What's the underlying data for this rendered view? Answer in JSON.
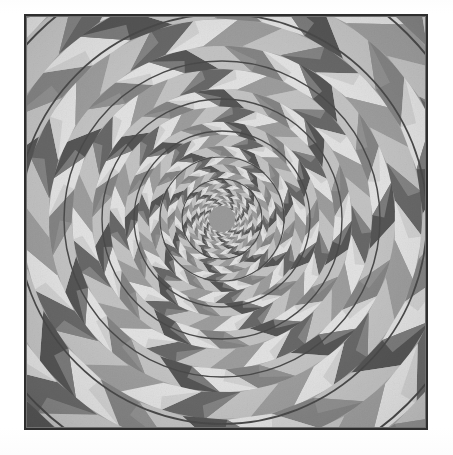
{
  "document": {
    "page_background": "#ffffff",
    "figure": {
      "name": "concentric-circles-illusion",
      "title": "",
      "caption": "",
      "frame": {
        "x": 24,
        "y": 14,
        "width": 404,
        "height": 416,
        "border_color": "#2e2e2e",
        "border_width": 2
      }
    }
  },
  "illusion": {
    "kind": "fraser-spiral",
    "description": "Concentric circles illusion: alternating light and dark wedge segments arranged in concentric annular bands, each band rotated relative to its neighbour, overlaid with thin dark circle outlines that appear to form a spiral.",
    "center": {
      "x": 198,
      "y": 205
    },
    "colors": {
      "light": "#e2e2e2",
      "mid_light": "#c3c3c3",
      "mid": "#9d9d9d",
      "mid_dark": "#848484",
      "dark": "#676767",
      "darkest": "#555555",
      "ring_line": "#4a4a4a",
      "center_disc": "#9a9a9a",
      "background": "#a5a5a5"
    },
    "geometry": {
      "sectors": 28,
      "band_count": 22,
      "band_growth": 1.155,
      "inner_radius": 13,
      "outer_radius": 330,
      "twist_per_band_deg": 6.4,
      "wedge_skew_deg": 5.5
    },
    "rings": [
      {
        "index": 1,
        "radius": 40,
        "stroke_width": 1.1
      },
      {
        "index": 2,
        "radius": 62,
        "stroke_width": 1.2
      },
      {
        "index": 3,
        "radius": 88,
        "stroke_width": 1.3
      },
      {
        "index": 4,
        "radius": 120,
        "stroke_width": 1.4
      },
      {
        "index": 5,
        "radius": 158,
        "stroke_width": 1.5
      },
      {
        "index": 6,
        "radius": 205,
        "stroke_width": 1.7
      },
      {
        "index": 7,
        "radius": 262,
        "stroke_width": 1.9
      },
      {
        "index": 8,
        "radius": 330,
        "stroke_width": 2.1
      }
    ]
  }
}
